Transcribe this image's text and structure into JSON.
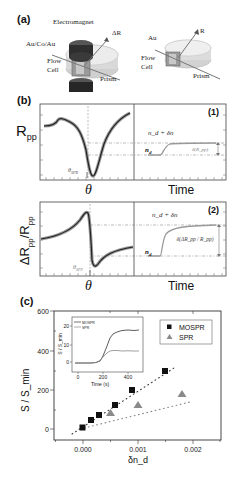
{
  "panel_a": {
    "label": "(a)",
    "left_device": {
      "electromagnet": "Electromagnet",
      "layers": "Au/Co/Au",
      "flow_cell_line1": "Flow",
      "flow_cell_line2": "Cell",
      "prism": "Prism",
      "beam": "ΔR"
    },
    "right_device": {
      "layer": "Au",
      "flow_cell_line1": "Flow",
      "flow_cell_line2": "Cell",
      "prism": "Prism",
      "beam": "R"
    }
  },
  "panel_b": {
    "label": "(b)",
    "row1": {
      "tag": "(1)",
      "ylabel": "R",
      "ylabel_sub": "pp",
      "theta_marker": "θ",
      "theta_marker_sub": "SPR",
      "xlabel_left": "θ",
      "xlabel_right": "Time",
      "level_low": "n",
      "level_low_sub": "d",
      "level_high": "n_d + δn",
      "delta_label": "δ(R_pp)"
    },
    "row2": {
      "tag": "(2)",
      "ylabel": "ΔR",
      "ylabel_sub": "pp",
      "ylabel_den": "/R",
      "ylabel_den_sub": "pp",
      "theta_marker": "θ",
      "theta_marker_sub": "SPP",
      "xlabel_left": "θ",
      "xlabel_right": "Time",
      "level_low": "n",
      "level_low_sub": "d",
      "level_high": "n_d + δn",
      "delta_label": "δ(ΔR_pp / R_pp)"
    }
  },
  "panel_c": {
    "label": "(c)"
  },
  "chart_data": {
    "type": "scatter",
    "title": "",
    "xlabel": "δn_d",
    "ylabel": "S / S_min",
    "xlim": [
      -0.0005,
      0.0025
    ],
    "ylim": [
      -50,
      600
    ],
    "x_ticks": [
      "0.000",
      "0.001",
      "0.002"
    ],
    "y_ticks": [
      "0",
      "200",
      "400",
      "600"
    ],
    "grid": false,
    "legend_position": "upper right",
    "series": [
      {
        "name": "MOSPR",
        "marker": "square",
        "color": "#111111",
        "x": [
          0.0,
          0.00015,
          0.0003,
          0.0006,
          0.0009,
          0.0015
        ],
        "y": [
          0,
          40,
          65,
          112,
          185,
          285
        ],
        "fit_line": {
          "style": "dotted",
          "x": [
            -0.0002,
            0.00165
          ],
          "y": [
            -25,
            315
          ]
        }
      },
      {
        "name": "SPR",
        "marker": "triangle",
        "color": "#888888",
        "x": [
          0.0005,
          0.001,
          0.0018
        ],
        "y": [
          38,
          70,
          125
        ],
        "fit_line": {
          "style": "dotted",
          "x": [
            -5e-05,
            0.00195
          ],
          "y": [
            0,
            140
          ]
        }
      }
    ],
    "inset": {
      "type": "line",
      "xlabel": "Time (s)",
      "ylabel": "S / S_min",
      "x_ticks": [
        "0",
        "200",
        "400"
      ],
      "y_ticks": [
        "0",
        "10",
        "20"
      ],
      "xlim": [
        -30,
        500
      ],
      "ylim": [
        -3,
        23
      ],
      "legend": [
        "MOSPR",
        "SPR"
      ],
      "series": [
        {
          "name": "MOSPR",
          "color": "#333333",
          "x": [
            0,
            50,
            100,
            150,
            180,
            200,
            230,
            260,
            290,
            320,
            360,
            400,
            440,
            480
          ],
          "y": [
            -1,
            -1,
            -1,
            -0.7,
            0,
            3,
            9,
            14,
            17,
            18,
            19,
            19.2,
            19,
            19.3
          ]
        },
        {
          "name": "SPR",
          "color": "#888888",
          "x": [
            0,
            50,
            100,
            150,
            180,
            200,
            230,
            260,
            290,
            320,
            360,
            400,
            440,
            480
          ],
          "y": [
            -1,
            -1,
            -1,
            -0.5,
            0.5,
            2.5,
            5,
            6,
            6.5,
            6.3,
            6.2,
            6.3,
            6.2,
            6.2
          ]
        }
      ]
    }
  }
}
